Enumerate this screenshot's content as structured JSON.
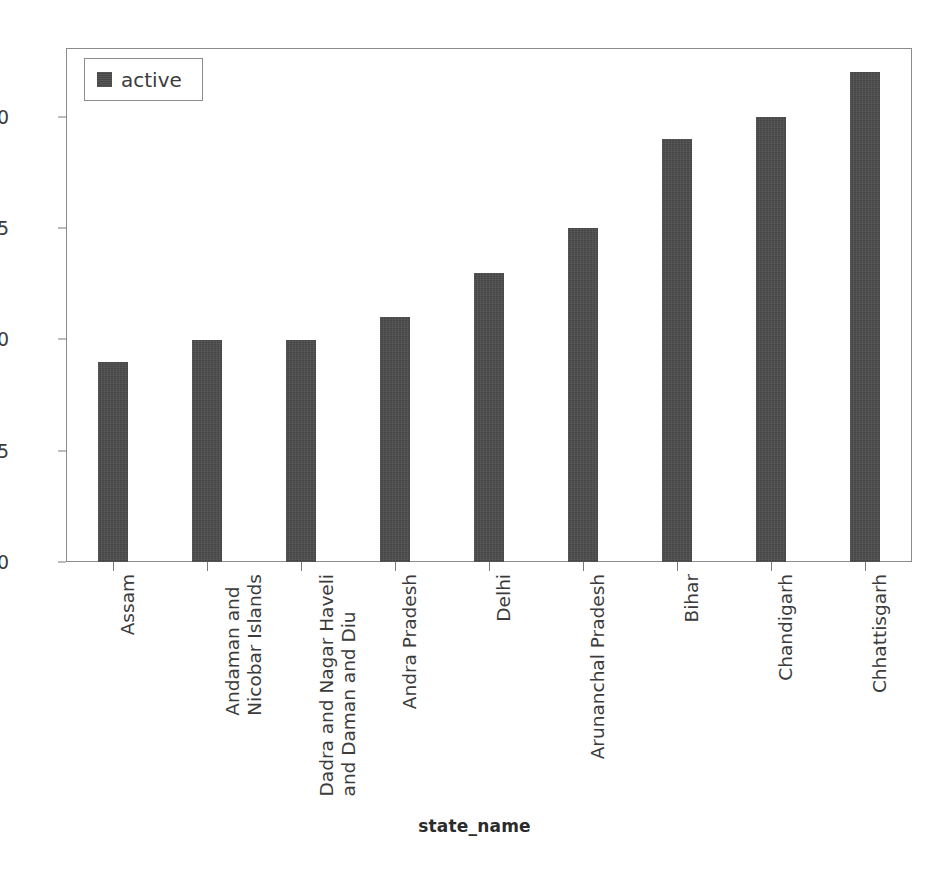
{
  "chart_data": {
    "type": "bar",
    "title": "",
    "subtitle": "",
    "xlabel": "state_name",
    "ylabel": "",
    "categories": [
      "Assam",
      "Andaman and Nicobar Islands",
      "Dadra and Nagar Haveli and Daman and Diu",
      "Andra Pradesh",
      "Delhi",
      "Arunanchal Pradesh",
      "Bihar",
      "Chandigarh",
      "Chhattisgarh"
    ],
    "category_lines": [
      [
        "Assam"
      ],
      [
        "Andaman and",
        "Nicobar Islands"
      ],
      [
        "Dadra and Nagar Haveli",
        "and Daman and Diu"
      ],
      [
        "Andra Pradesh"
      ],
      [
        "Delhi"
      ],
      [
        "Arunanchal Pradesh"
      ],
      [
        "Bihar"
      ],
      [
        "Chandigarh"
      ],
      [
        "Chhattisgarh"
      ]
    ],
    "series": [
      {
        "name": "active",
        "values": [
          9,
          10,
          10,
          11,
          13,
          15,
          19,
          20,
          22
        ]
      }
    ],
    "values": [
      9,
      10,
      10,
      11,
      13,
      15,
      19,
      20,
      22
    ],
    "ylim": [
      0,
      23.1
    ],
    "yticks": [
      0,
      5,
      10,
      15,
      20
    ],
    "ytick_labels": [
      "0",
      "5",
      "10",
      "15",
      "20"
    ],
    "grid": false,
    "legend": {
      "position": "top-left",
      "entries": [
        {
          "label": "active",
          "color": "#4c4c4c"
        }
      ]
    },
    "bar_color": "#4c4c4c",
    "frame_color": "#8c8c8c",
    "background": "#ffffff"
  },
  "legend": {
    "entry_label": "active"
  },
  "axis": {
    "x_title": "state_name"
  }
}
